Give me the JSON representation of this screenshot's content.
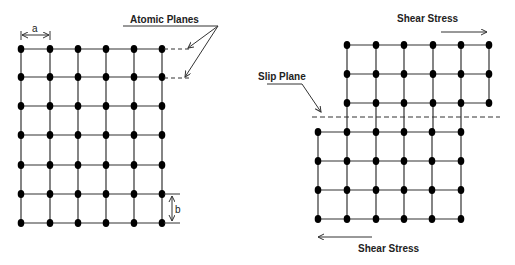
{
  "diagram": {
    "colors": {
      "line": "#333333",
      "atom": "#000000",
      "background": "#ffffff"
    },
    "left_lattice": {
      "columns_x": [
        21,
        50,
        78,
        106,
        134,
        162
      ],
      "rows_y": [
        49,
        77,
        106,
        135,
        165,
        194,
        223
      ],
      "labels": {
        "atomic_planes": "Atomic Planes",
        "spacing_a": "a",
        "spacing_b": "b"
      }
    },
    "right_lattice": {
      "upper_block": {
        "columns_x": [
          347,
          376,
          404,
          433,
          461,
          489
        ],
        "rows_y": [
          45,
          74,
          103
        ]
      },
      "lower_block": {
        "columns_x": [
          318,
          347,
          376,
          404,
          432,
          461
        ],
        "rows_y": [
          132,
          161,
          190,
          219
        ]
      },
      "slip_plane_y": 117,
      "labels": {
        "slip_plane": "Slip Plane",
        "shear_stress_top": "Shear Stress",
        "shear_stress_bottom": "Shear Stress"
      },
      "shear_top_direction": "right",
      "shear_bottom_direction": "left"
    }
  }
}
